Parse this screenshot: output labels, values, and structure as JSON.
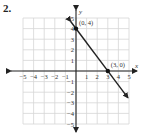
{
  "problem_number": "2.",
  "chart_data": {
    "type": "line",
    "title": "",
    "xlabel": "x",
    "ylabel": "y",
    "xlim": [
      -5,
      5
    ],
    "ylim": [
      -5,
      5
    ],
    "grid": true,
    "x_ticks": [
      -5,
      -4,
      -3,
      -2,
      -1,
      1,
      2,
      3,
      4,
      5
    ],
    "y_ticks": [
      -5,
      -4,
      -3,
      -2,
      -1,
      1,
      2,
      3,
      4,
      5
    ],
    "series": [
      {
        "name": "line",
        "x": [
          -0.5,
          4.9
        ],
        "y": [
          4.67,
          -2.53
        ],
        "arrows": "both"
      }
    ],
    "points": [
      {
        "x": 0,
        "y": 4,
        "label": "(0, 4)"
      },
      {
        "x": 3,
        "y": 0,
        "label": "(3, 0)"
      }
    ],
    "annotations": [
      "(0, 4)",
      "(3, 0)"
    ]
  }
}
